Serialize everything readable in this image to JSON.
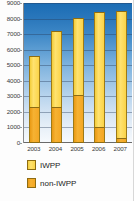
{
  "chart_data": {
    "type": "bar",
    "subtype": "stacked-bar",
    "title": "",
    "xlabel": "",
    "ylabel": "",
    "categories": [
      "2003",
      "2004",
      "2005",
      "2006",
      "2007"
    ],
    "series": [
      {
        "name": "non-IWPP",
        "color": "#f4a723",
        "values": [
          2300,
          2300,
          3100,
          1050,
          300
        ]
      },
      {
        "name": "IWPP",
        "color": "#fbd448",
        "values": [
          3300,
          4900,
          4950,
          7400,
          8200
        ]
      }
    ],
    "totals": [
      5600,
      7200,
      8050,
      8450,
      8500
    ],
    "ylim": [
      0,
      9000
    ],
    "ytick_labels": [
      "0",
      "1000",
      "2000",
      "3000",
      "4000",
      "5000",
      "6000",
      "7000",
      "8000",
      "9000"
    ],
    "ytick_values": [
      0,
      1000,
      2000,
      3000,
      4000,
      5000,
      6000,
      7000,
      8000,
      9000
    ],
    "grid": true,
    "legend_position": "bottom-left",
    "plot_background": "blue-vertical-gradient",
    "plot_background_top_color": "#1a6cb4",
    "plot_background_bottom_color": "#f7fafd"
  },
  "legend": {
    "items": [
      {
        "label": "IWPP",
        "color": "#fbd448"
      },
      {
        "label": "non-IWPP",
        "color": "#f4a723"
      }
    ]
  }
}
